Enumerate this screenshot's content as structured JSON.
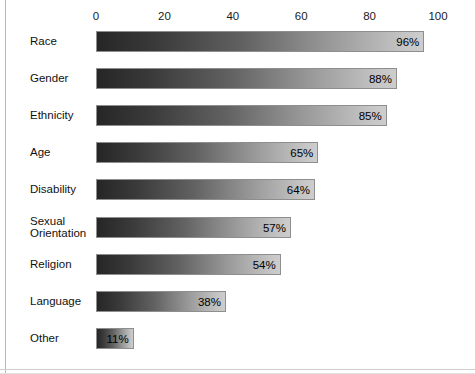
{
  "chart_data": {
    "type": "bar",
    "orientation": "horizontal",
    "title": "",
    "subtitle": "",
    "xlabel": "",
    "ylabel": "",
    "xlim": [
      0,
      100
    ],
    "grid": false,
    "legend": null,
    "value_suffix": "%",
    "tick_labels": [
      "0",
      "20",
      "40",
      "60",
      "80",
      "100"
    ],
    "ticks": [
      0,
      20,
      40,
      60,
      80,
      100
    ],
    "categories": [
      "Race",
      "Gender",
      "Ethnicity",
      "Age",
      "Disability",
      "Sexual\nOrientation",
      "Religion",
      "Language",
      "Other"
    ],
    "values": [
      96,
      88,
      85,
      65,
      64,
      57,
      54,
      38,
      11
    ],
    "value_labels": [
      "96%",
      "88%",
      "85%",
      "65%",
      "64%",
      "57%",
      "54%",
      "38%",
      "11%"
    ],
    "colors": {
      "bar_gradient_start": "#262626",
      "bar_gradient_end": "#cdcdcd",
      "bar_border": "#8e8e8e",
      "text": "#111111",
      "background": "#ffffff",
      "frame": "#b9b9b9"
    }
  }
}
